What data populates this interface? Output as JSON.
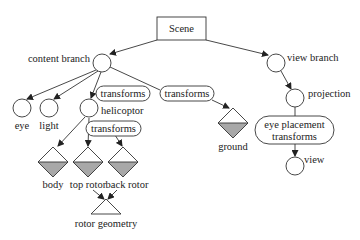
{
  "diagram": {
    "type": "scene-graph",
    "colors": {
      "stroke": "#333333",
      "fill_shaded": "#a8a8a8",
      "background": "#ffffff"
    },
    "root": {
      "label": "Scene",
      "shape": "rectangle"
    },
    "nodes": {
      "content_branch": {
        "label": "content branch",
        "shape": "circle"
      },
      "view_branch": {
        "label": "view branch",
        "shape": "circle"
      },
      "eye": {
        "label": "eye",
        "shape": "circle"
      },
      "light": {
        "label": "light",
        "shape": "circle"
      },
      "helicopter": {
        "label": "helicoptor",
        "shape": "circle"
      },
      "ground": {
        "label": "ground",
        "shape": "diamond"
      },
      "projection": {
        "label": "projection",
        "shape": "circle"
      },
      "view": {
        "label": "view",
        "shape": "circle"
      },
      "body": {
        "label": "body",
        "shape": "diamond"
      },
      "top_rotor": {
        "label": "top rotor",
        "shape": "diamond"
      },
      "back_rotor": {
        "label": "back rotor",
        "shape": "diamond"
      },
      "rotor_geometry": {
        "label": "rotor geometry",
        "shape": "triangle"
      }
    },
    "transforms": {
      "helicopter_transform": {
        "label": "transforms"
      },
      "ground_transform": {
        "label": "transforms"
      },
      "rotor_transform": {
        "label": "transforms"
      },
      "eye_placement_line1": "eye placement",
      "eye_placement_line2": "transforms"
    },
    "edges": [
      [
        "Scene",
        "content branch"
      ],
      [
        "Scene",
        "view branch"
      ],
      [
        "content branch",
        "eye"
      ],
      [
        "content branch",
        "light"
      ],
      [
        "content branch",
        "helicoptor"
      ],
      [
        "content branch",
        "ground"
      ],
      [
        "helicoptor",
        "body"
      ],
      [
        "helicoptor",
        "top rotor"
      ],
      [
        "helicoptor",
        "back rotor"
      ],
      [
        "top rotor",
        "rotor geometry"
      ],
      [
        "back rotor",
        "rotor geometry"
      ],
      [
        "view branch",
        "projection"
      ],
      [
        "projection",
        "view"
      ]
    ]
  }
}
